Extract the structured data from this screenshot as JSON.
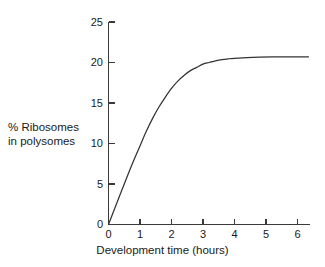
{
  "figure": {
    "background_color": "#ffffff",
    "axis_color": "#3a3a3a",
    "curve_color": "#333333",
    "text_color": "#1a1a1a"
  },
  "ylabel_lines": {
    "line1": "% Ribosomes",
    "line2": "in polysomes"
  },
  "xlabel": "Development time (hours)",
  "chart_data": {
    "type": "line",
    "title": "",
    "xlabel": "Development time (hours)",
    "ylabel": "% Ribosomes in polysomes",
    "xlim": [
      0,
      6.4
    ],
    "ylim": [
      0,
      25
    ],
    "xticks": [
      0,
      1,
      2,
      3,
      4,
      5,
      6
    ],
    "xticklabels": [
      "0",
      "1",
      "2",
      "3",
      "4",
      "5",
      "6"
    ],
    "yticks": [
      0,
      5,
      10,
      15,
      20,
      25
    ],
    "yticklabels": [
      "0",
      "5",
      "10",
      "15",
      "20",
      "25"
    ],
    "grid": false,
    "legend": false,
    "tick_direction": "in",
    "spines": [
      "left",
      "bottom"
    ],
    "series": [
      {
        "name": "% Ribosomes in polysomes",
        "color": "#333333",
        "x": [
          0.0,
          0.2,
          0.4,
          0.6,
          0.8,
          1.0,
          1.2,
          1.4,
          1.6,
          1.8,
          2.0,
          2.2,
          2.4,
          2.6,
          2.8,
          3.0,
          3.2,
          3.4,
          3.6,
          3.8,
          4.0,
          4.4,
          4.8,
          5.2,
          5.6,
          6.0,
          6.35
        ],
        "y": [
          0.0,
          2.0,
          4.0,
          6.0,
          7.9,
          9.7,
          11.5,
          13.1,
          14.5,
          15.7,
          16.8,
          17.7,
          18.4,
          19.0,
          19.4,
          19.8,
          20.0,
          20.2,
          20.35,
          20.45,
          20.52,
          20.6,
          20.65,
          20.68,
          20.7,
          20.7,
          20.7
        ]
      }
    ],
    "annotations": {
      "plateau_value": 20.7,
      "curve_shape": "saturating exponential rise to plateau"
    }
  }
}
